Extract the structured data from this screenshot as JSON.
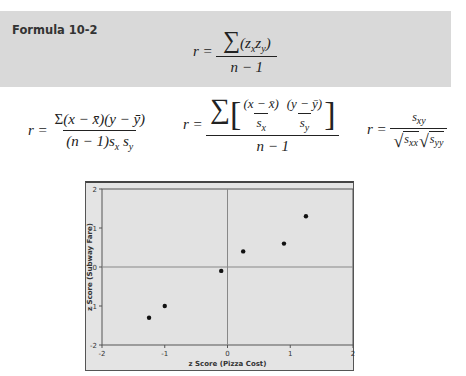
{
  "formula_box": {
    "title": "Formula 10-2",
    "main_formula": {
      "lhs": "r =",
      "numerator": "∑(z_x z_y)",
      "denominator": "n − 1"
    }
  },
  "alt_formulas": [
    {
      "lhs": "r =",
      "numerator": "Σ(x − x̄)(y − ȳ)",
      "denominator": "(n − 1)s_x s_y"
    },
    {
      "lhs": "r =",
      "numerator": "∑[ (x − x̄)/s_x · (y − ȳ)/s_y ]",
      "denominator": "n − 1"
    },
    {
      "lhs": "r =",
      "numerator": "s_xy",
      "denominator": "√s_xx √s_yy"
    }
  ],
  "chart_data": {
    "type": "scatter",
    "title": "",
    "xlabel": "z Score (Pizza Cost)",
    "ylabel": "z Score (Subway Fare)",
    "xlim": [
      -2,
      2
    ],
    "ylim": [
      -2,
      2
    ],
    "xticks": [
      "-2",
      "-1",
      "0",
      "1",
      "2"
    ],
    "yticks": [
      "-2",
      "-1",
      "0",
      "1",
      "2"
    ],
    "grid": false,
    "reference_lines": {
      "x": 0,
      "y": 0
    },
    "legend": null,
    "series": [
      {
        "name": "points",
        "x": [
          -1.25,
          -1.0,
          -0.1,
          0.25,
          0.9,
          1.25
        ],
        "y": [
          -1.3,
          -1.0,
          -0.1,
          0.4,
          0.6,
          1.3
        ]
      }
    ]
  },
  "colors": {
    "formula_box_bg": "#d9d9d9",
    "chart_bg": "#e4e4e4",
    "axis": "#666666",
    "point": "#111111"
  }
}
